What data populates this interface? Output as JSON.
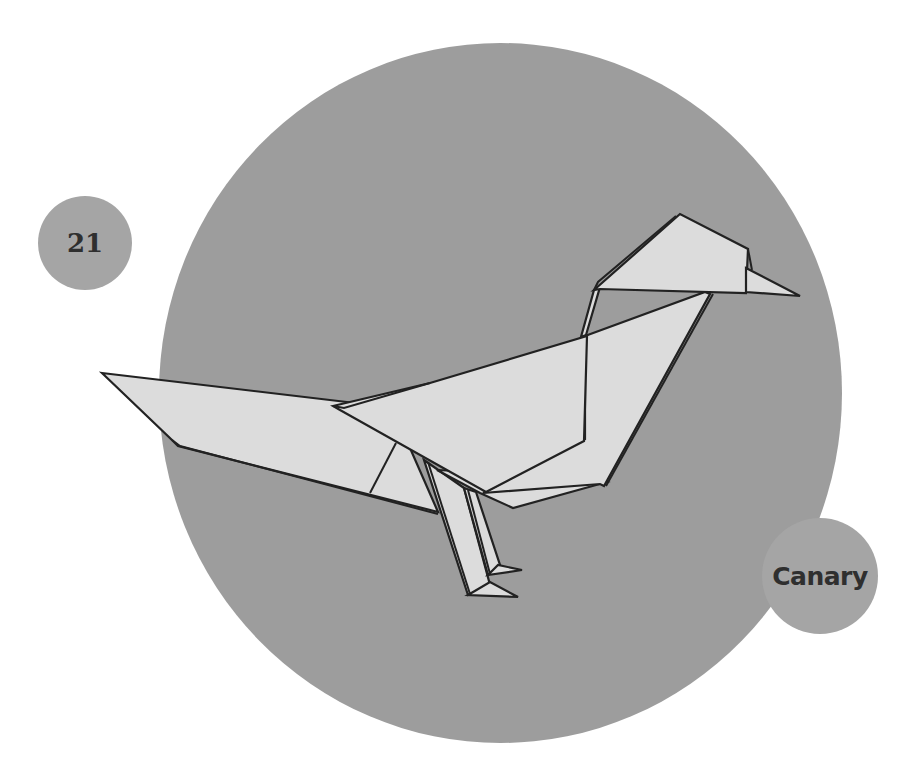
{
  "page": {
    "number": "21",
    "title": "Canary"
  },
  "illustration": {
    "subject": "origami-canary",
    "colors": {
      "background": "#ffffff",
      "circle": "#9d9d9d",
      "badge": "#a5a5a5",
      "paper": "#dcdcdc",
      "outline": "#222222",
      "text": "#2f2f2f"
    }
  }
}
